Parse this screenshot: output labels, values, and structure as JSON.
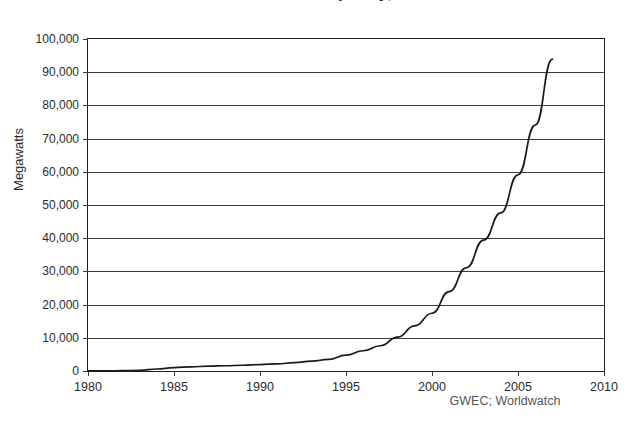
{
  "chart_data": {
    "type": "line",
    "title": "Global Wind Power Capacity, 1980-2007",
    "subtitle": "",
    "xlabel": "",
    "ylabel": "Megawatts",
    "source": "GWEC; Worldwatch",
    "grid": true,
    "legend": false,
    "xlim": [
      1980,
      2010
    ],
    "ylim": [
      0,
      100000
    ],
    "xticks": [
      1980,
      1985,
      1990,
      1995,
      2000,
      2005,
      2010
    ],
    "xtick_labels": [
      "1980",
      "1985",
      "1990",
      "1995",
      "2000",
      "2005",
      "2010"
    ],
    "yticks": [
      0,
      10000,
      20000,
      30000,
      40000,
      50000,
      60000,
      70000,
      80000,
      90000,
      100000
    ],
    "ytick_labels": [
      "0",
      "10,000",
      "20,000",
      "30,000",
      "40,000",
      "50,000",
      "60,000",
      "70,000",
      "80,000",
      "90,000",
      "100,000"
    ],
    "series": [
      {
        "name": "Global wind power capacity",
        "color": "#1a1a1a",
        "x": [
          1980,
          1981,
          1982,
          1983,
          1984,
          1985,
          1986,
          1987,
          1988,
          1989,
          1990,
          1991,
          1992,
          1993,
          1994,
          1995,
          1996,
          1997,
          1998,
          1999,
          2000,
          2001,
          2002,
          2003,
          2004,
          2005,
          2006,
          2007
        ],
        "values": [
          10,
          25,
          90,
          210,
          600,
          1020,
          1270,
          1450,
          1580,
          1730,
          1930,
          2170,
          2510,
          2990,
          3490,
          4780,
          6100,
          7600,
          10200,
          13600,
          17400,
          23900,
          31100,
          39431,
          47620,
          59091,
          74052,
          93927
        ]
      }
    ],
    "annotations": []
  }
}
